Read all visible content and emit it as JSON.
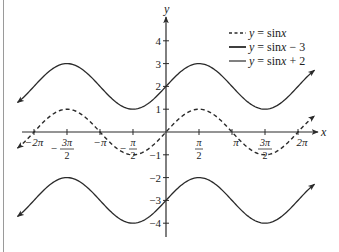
{
  "chart_data": {
    "type": "line",
    "title": "",
    "xlabel": "x",
    "ylabel": "y",
    "xlim_radians": [
      -6.9,
      6.9
    ],
    "ylim": [
      -4.4,
      4.6
    ],
    "grid": false,
    "legend_position": "upper right",
    "x_ticks": [
      {
        "value": -6.2832,
        "label": "−2π"
      },
      {
        "value": -4.7124,
        "label": "3π/2",
        "sign": "−"
      },
      {
        "value": -3.1416,
        "label": "−π"
      },
      {
        "value": -1.5708,
        "label": "π/2",
        "sign": "−"
      },
      {
        "value": 1.5708,
        "label": "π/2"
      },
      {
        "value": 3.1416,
        "label": "π"
      },
      {
        "value": 4.7124,
        "label": "3π/2"
      },
      {
        "value": 6.2832,
        "label": "2π"
      }
    ],
    "y_ticks": [
      4,
      3,
      2,
      1,
      -1,
      -2,
      -3,
      -4
    ],
    "series": [
      {
        "name": "y = sin x",
        "legend": {
          "prefix": "y",
          "eq": " = sin",
          "var": "x",
          "suffix": ""
        },
        "style": "dashed",
        "shift": 0,
        "x_range": [
          -7.07,
          7.07
        ]
      },
      {
        "name": "y = sin x − 3",
        "legend": {
          "prefix": "y",
          "eq": " = sin",
          "var": "x",
          "suffix": " − 3"
        },
        "style": "solid",
        "shift": -3,
        "x_range": [
          -7.07,
          7.07
        ]
      },
      {
        "name": "y = sin x + 2",
        "legend": {
          "prefix": "y",
          "eq": " = sin",
          "var": "x",
          "suffix": " + 2"
        },
        "style": "solid",
        "shift": 2,
        "x_range": [
          -7.07,
          7.07
        ]
      }
    ],
    "colors": {
      "curve": "#2a2a2a",
      "axis": "#2a2a2a",
      "frame": "#9a9a9a"
    }
  }
}
